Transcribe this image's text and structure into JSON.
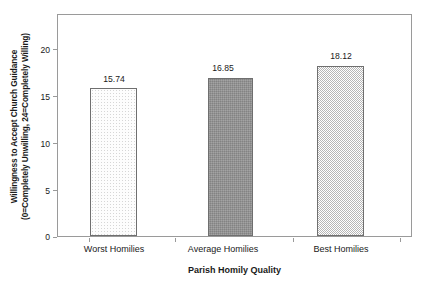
{
  "chart_data": {
    "type": "bar",
    "title": "",
    "categories": [
      "Worst Homilies",
      "Average Homilies",
      "Best Homilies"
    ],
    "values": [
      15.74,
      16.85,
      18.12
    ],
    "value_labels": [
      "15.74",
      "16.85",
      "18.12"
    ],
    "xlabel": "Parish Homily Quality",
    "ylabel_line1": "Willingness to Accept Church Guidance",
    "ylabel_line2": "(0=Completely Unwilling, 24=Completely Willing)",
    "ylim": [
      0,
      23.5
    ],
    "yticks": [
      0,
      5,
      10,
      15,
      20
    ],
    "ytick_labels": [
      "0",
      "5",
      "10",
      "15",
      "20"
    ],
    "grid": false,
    "legend": "none",
    "series": [
      {
        "name": "Willingness to Accept Church Guidance",
        "values": [
          15.74,
          16.85,
          18.12
        ]
      }
    ],
    "bar_styles": [
      "light-dotted",
      "dark-gray",
      "light-checkered"
    ],
    "colors": {
      "bar1_fill": "#fdfdfd",
      "bar2_fill": "#8d8d8d",
      "bar3_fill": "#d2d2d2",
      "bar_edge": "#6f6f6f",
      "axis": "#9a9a9a",
      "text": "#1a1a1a",
      "background": "#ffffff"
    }
  },
  "axes": {
    "y_tick_0": "0",
    "y_tick_1": "5",
    "y_tick_2": "10",
    "y_tick_3": "15",
    "y_tick_4": "20"
  },
  "bars": {
    "b0": {
      "label": "Worst Homilies",
      "value": "15.74"
    },
    "b1": {
      "label": "Average Homilies",
      "value": "16.85"
    },
    "b2": {
      "label": "Best Homilies",
      "value": "18.12"
    }
  }
}
